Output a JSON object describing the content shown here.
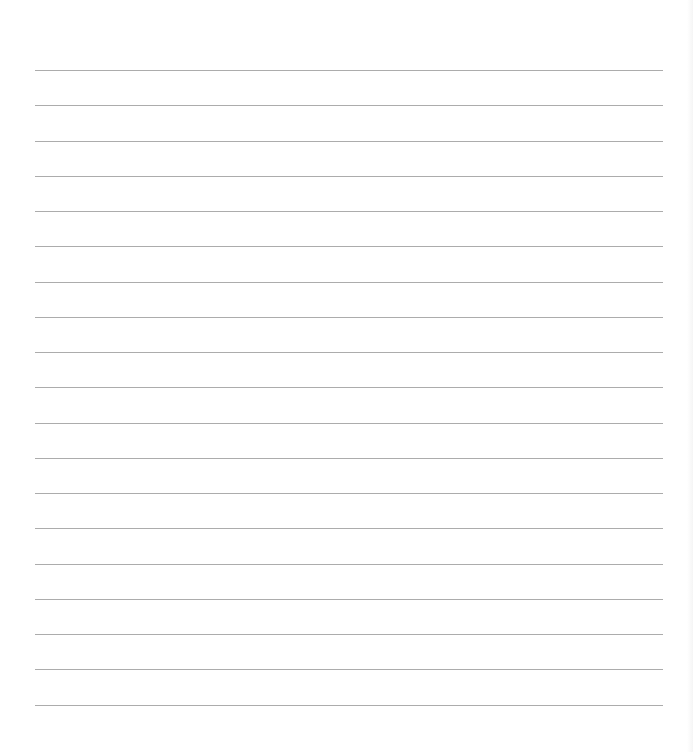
{
  "sheet": {
    "type": "lined-paper",
    "background_color": "#ffffff",
    "line_color": "#a8a8a8",
    "line_count": 19,
    "line_left_px": 35,
    "line_right_px": 663,
    "first_line_y_px": 70,
    "line_spacing_px": 35.25,
    "text": ""
  }
}
